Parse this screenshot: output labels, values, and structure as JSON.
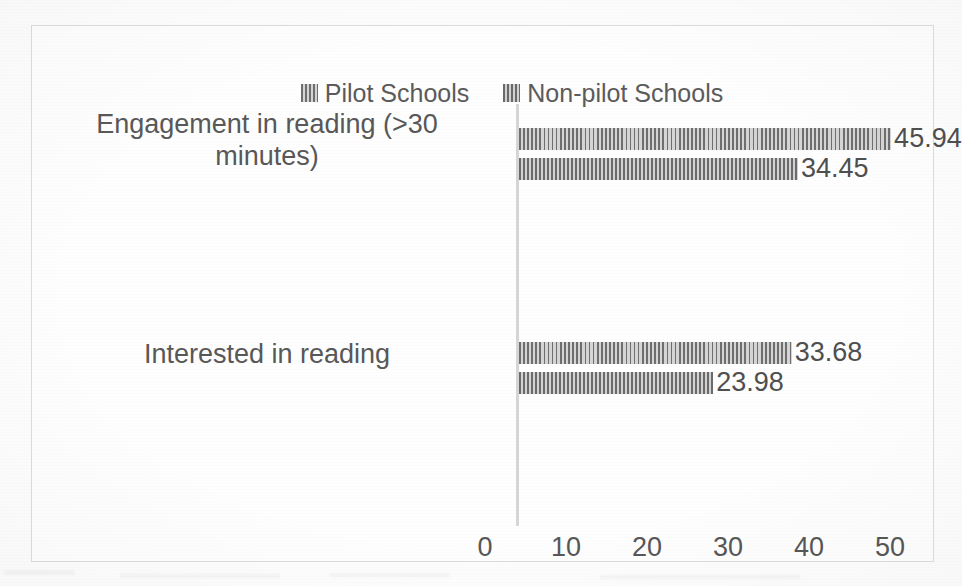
{
  "chart_data": {
    "type": "bar",
    "orientation": "horizontal",
    "title": "",
    "subtitle": "",
    "xlabel": "",
    "ylabel": "",
    "categories": [
      "Engagement in reading (>30 minutes)",
      "Interested in reading"
    ],
    "series": [
      {
        "name": "Pilot Schools",
        "values": [
          45.94,
          33.68
        ],
        "color": "#9a9a9a",
        "pattern": "vertical-hatch"
      },
      {
        "name": "Non-pilot Schools",
        "values": [
          34.45,
          23.98
        ],
        "color": "#8f8f8f",
        "pattern": "vertical-hatch"
      }
    ],
    "data_labels": [
      "45.94",
      "34.45",
      "33.68",
      "23.98"
    ],
    "xlim": [
      0,
      50
    ],
    "xticks": [
      0,
      10,
      20,
      30,
      40,
      50
    ],
    "xtick_labels": [
      "0",
      "10",
      "20",
      "30",
      "40",
      "50"
    ],
    "grid": false,
    "legend_position": "top",
    "border": true,
    "border_color": "#dcdcdc"
  },
  "legend": {
    "entries": [
      {
        "label": "Pilot Schools",
        "swatch": "hatch-swatch-pilot"
      },
      {
        "label": "Non-pilot Schools",
        "swatch": "hatch-swatch-nonpilot"
      }
    ]
  },
  "categories": {
    "engagement": {
      "line1": "Engagement in reading (>30",
      "line2": "minutes)"
    },
    "interested": {
      "line1": "Interested in reading"
    }
  },
  "bars": {
    "engagement_pilot": {
      "value": 45.94,
      "label": "45.94",
      "series": "Pilot Schools"
    },
    "engagement_nonpilot": {
      "value": 34.45,
      "label": "34.45",
      "series": "Non-pilot Schools"
    },
    "interested_pilot": {
      "value": 33.68,
      "label": "33.68",
      "series": "Pilot Schools"
    },
    "interested_nonpilot": {
      "value": 23.98,
      "label": "23.98",
      "series": "Non-pilot Schools"
    }
  },
  "axis": {
    "ticks": [
      {
        "label": "0"
      },
      {
        "label": "10"
      },
      {
        "label": "20"
      },
      {
        "label": "30"
      },
      {
        "label": "40"
      },
      {
        "label": "50"
      }
    ]
  }
}
